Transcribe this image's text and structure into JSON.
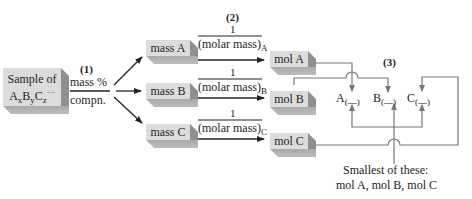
{
  "steps": {
    "one": "(1)",
    "two": "(2)",
    "three": "(3)"
  },
  "sample": {
    "line1": "Sample of",
    "formula": {
      "A": "A",
      "x": "x",
      "B": "B",
      "y": "y",
      "C": "C",
      "z": "z",
      "ellipsis": "···"
    }
  },
  "step1_label": {
    "top": "mass %",
    "bottom": "compn."
  },
  "mass_boxes": [
    {
      "label": "mass A"
    },
    {
      "label": "mass B"
    },
    {
      "label": "mass C"
    }
  ],
  "conversion": [
    {
      "numerator": "1",
      "denominator": "(molar mass)",
      "sub": "A"
    },
    {
      "numerator": "1",
      "denominator": "(molar mass)",
      "sub": "B"
    },
    {
      "numerator": "1",
      "denominator": "(molar mass)",
      "sub": "C"
    }
  ],
  "mol_boxes": [
    {
      "label": "mol A"
    },
    {
      "label": "mol B"
    },
    {
      "label": "mol C"
    }
  ],
  "formula_slots": [
    {
      "symbol": "A",
      "sub": "(—)"
    },
    {
      "symbol": "B",
      "sub": "(—)"
    },
    {
      "symbol": "C",
      "sub": "(—)"
    }
  ],
  "divisor_note": {
    "line1": "Smallest of these:",
    "line2": "mol A, mol B, mol C"
  }
}
